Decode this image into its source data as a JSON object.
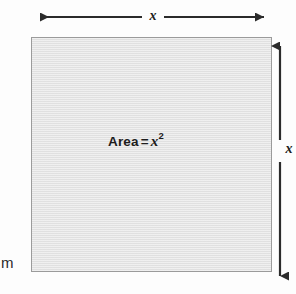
{
  "figure": {
    "type": "geometry-diagram",
    "background_color": "#fdfdfd"
  },
  "shape": {
    "name": "square",
    "fill_color": "#e3e3e3",
    "border_color": "#9b9b9b",
    "area_label": {
      "text": "Area",
      "equals": "=",
      "variable": "x",
      "exponent": "2"
    }
  },
  "dimensions": {
    "top": {
      "label": "x",
      "orientation": "horizontal",
      "arrowheads": "both"
    },
    "right": {
      "label": "x",
      "orientation": "vertical",
      "arrowheads": "both"
    }
  },
  "margin": {
    "clipped_text": "m"
  },
  "colors": {
    "ink": "#1d1d1d",
    "arrow": "#2b2b2b",
    "fill": "#e3e3e3",
    "stroke": "#9b9b9b"
  }
}
